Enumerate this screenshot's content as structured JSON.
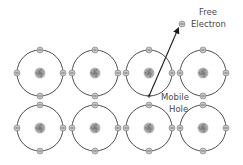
{
  "diagram": {
    "title": "",
    "colors": {
      "orbit": "#3a3a3a",
      "electron_fill": "#c8c8c8",
      "electron_stroke": "#777777",
      "nucleus": "#9a9a9a",
      "arrow": "#1a1a1a",
      "label": "#4a4a4a"
    },
    "atoms": {
      "rows": [
        73,
        128
      ],
      "columns": [
        40,
        95,
        149,
        203
      ],
      "orbit_radius": 23,
      "electron_positions": [
        "top",
        "right",
        "bottom",
        "left"
      ]
    },
    "missing_electron": {
      "row": 0,
      "column": 2,
      "position": "bottom",
      "marker": "+"
    },
    "free_electron": {
      "x": 182,
      "y": 24,
      "symbol": "⊖"
    },
    "arrow": {
      "from": [
        149,
        96
      ],
      "to": [
        178,
        29
      ]
    },
    "labels": {
      "free_electron_line1": "Free",
      "free_electron_line2": "Electron",
      "hole_line1": "Mobile",
      "hole_line2": "Hole"
    }
  }
}
